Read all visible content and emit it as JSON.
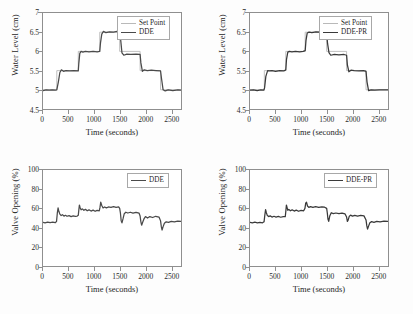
{
  "figure": {
    "background": "#fdfdfd",
    "axis_color": "#8f8f8f"
  },
  "colors": {
    "setpoint": "#b9b9b9",
    "dde": "#4a4a4a",
    "ddepr": "#3a3a3a"
  },
  "chart_data": [
    {
      "id": "water-level-dde",
      "type": "line",
      "title": "",
      "xlabel": "Time (seconds)",
      "ylabel": "Water Level (cm)",
      "xlim": [
        0,
        2700
      ],
      "ylim": [
        4.5,
        7
      ],
      "xticks": [
        0,
        500,
        1000,
        1500,
        2000,
        2500
      ],
      "yticks": [
        4.5,
        5,
        5.5,
        6,
        6.5,
        7
      ],
      "ytick_labels": [
        "4.5",
        "5",
        "5.5",
        "6",
        "6.5",
        "7"
      ],
      "xtick_labels": [
        "0",
        "500",
        "1000",
        "1500",
        "2000",
        "2500"
      ],
      "grid": false,
      "legend_position": "top-right",
      "series": [
        {
          "name": "Set Point",
          "color": "#b9b9b9",
          "x": [
            0,
            270,
            270,
            690,
            690,
            1110,
            1110,
            1500,
            1500,
            1900,
            1900,
            2300,
            2300,
            2700
          ],
          "y": [
            5,
            5,
            5.5,
            5.5,
            6,
            6,
            6.5,
            6.5,
            6,
            6,
            5.5,
            5.5,
            5,
            5
          ]
        },
        {
          "name": "DDE",
          "color": "#4a4a4a",
          "x": [
            0,
            60,
            120,
            180,
            240,
            270,
            300,
            330,
            360,
            400,
            450,
            520,
            600,
            690,
            700,
            720,
            745,
            780,
            830,
            900,
            980,
            1060,
            1110,
            1125,
            1150,
            1180,
            1230,
            1300,
            1380,
            1450,
            1500,
            1520,
            1545,
            1580,
            1640,
            1720,
            1820,
            1900,
            1915,
            1945,
            1980,
            2040,
            2120,
            2210,
            2300,
            2320,
            2350,
            2390,
            2450,
            2540,
            2640,
            2700
          ],
          "y": [
            4.98,
            5.0,
            4.99,
            5.0,
            4.99,
            5.0,
            5.2,
            5.45,
            5.52,
            5.48,
            5.5,
            5.49,
            5.5,
            5.49,
            5.68,
            5.95,
            6.0,
            5.98,
            6.0,
            5.99,
            6.0,
            5.99,
            6.0,
            6.22,
            6.45,
            6.52,
            6.49,
            6.51,
            6.5,
            6.52,
            6.5,
            6.3,
            5.96,
            5.9,
            5.93,
            5.92,
            5.93,
            5.92,
            5.7,
            5.48,
            5.52,
            5.5,
            5.51,
            5.5,
            5.49,
            5.28,
            5.0,
            4.97,
            5.0,
            4.98,
            5.0,
            4.99
          ]
        }
      ]
    },
    {
      "id": "water-level-ddepr",
      "type": "line",
      "title": "",
      "xlabel": "Time (seconds)",
      "ylabel": "Water Level (cm)",
      "xlim": [
        0,
        2700
      ],
      "ylim": [
        4.5,
        7
      ],
      "xticks": [
        0,
        500,
        1000,
        1500,
        2000,
        2500
      ],
      "yticks": [
        4.5,
        5,
        5.5,
        6,
        6.5,
        7
      ],
      "ytick_labels": [
        "4.5",
        "5",
        "5.5",
        "6",
        "6.5",
        "7"
      ],
      "xtick_labels": [
        "0",
        "500",
        "1000",
        "1500",
        "2000",
        "2500"
      ],
      "grid": false,
      "legend_position": "top-right",
      "series": [
        {
          "name": "Set Point",
          "color": "#b9b9b9",
          "x": [
            0,
            280,
            280,
            700,
            700,
            1080,
            1080,
            1500,
            1500,
            1890,
            1890,
            2270,
            2270,
            2700
          ],
          "y": [
            5,
            5,
            5.5,
            5.5,
            6,
            6,
            6.5,
            6.5,
            6,
            6,
            5.5,
            5.5,
            5,
            5
          ]
        },
        {
          "name": "DDE-PR",
          "color": "#3a3a3a",
          "x": [
            0,
            70,
            140,
            210,
            270,
            285,
            310,
            345,
            380,
            430,
            500,
            580,
            660,
            700,
            715,
            740,
            770,
            820,
            890,
            970,
            1040,
            1080,
            1095,
            1120,
            1155,
            1210,
            1290,
            1380,
            1460,
            1500,
            1518,
            1545,
            1580,
            1650,
            1740,
            1840,
            1890,
            1905,
            1935,
            1975,
            2040,
            2130,
            2220,
            2270,
            2290,
            2320,
            2370,
            2440,
            2530,
            2630,
            2700
          ],
          "y": [
            4.99,
            5.0,
            4.98,
            5.0,
            4.99,
            5.05,
            5.35,
            5.5,
            5.49,
            5.5,
            5.48,
            5.5,
            5.49,
            5.52,
            5.8,
            5.98,
            6.0,
            5.99,
            6.0,
            5.99,
            6.0,
            6.02,
            6.28,
            6.48,
            6.5,
            6.49,
            6.51,
            6.5,
            6.5,
            6.48,
            6.2,
            5.97,
            5.9,
            5.92,
            5.91,
            5.92,
            5.9,
            5.65,
            5.47,
            5.51,
            5.5,
            5.49,
            5.5,
            5.48,
            5.2,
            4.98,
            5.0,
            4.99,
            5.0,
            5.0,
            5.0
          ]
        }
      ]
    },
    {
      "id": "valve-opening-dde",
      "type": "line",
      "title": "",
      "xlabel": "Time (seconds)",
      "ylabel": "Valve Opening (%)",
      "xlim": [
        0,
        2700
      ],
      "ylim": [
        0,
        100
      ],
      "xticks": [
        0,
        500,
        1000,
        1500,
        2000,
        2500
      ],
      "yticks": [
        0,
        20,
        40,
        60,
        80,
        100
      ],
      "ytick_labels": [
        "0",
        "20",
        "40",
        "60",
        "80",
        "100"
      ],
      "xtick_labels": [
        "0",
        "500",
        "1000",
        "1500",
        "2000",
        "2500"
      ],
      "grid": false,
      "legend_position": "top-right",
      "series": [
        {
          "name": "DDE",
          "color": "#4a4a4a",
          "x": [
            0,
            40,
            90,
            140,
            190,
            240,
            265,
            280,
            295,
            310,
            330,
            355,
            380,
            410,
            440,
            470,
            510,
            550,
            590,
            630,
            670,
            690,
            700,
            712,
            725,
            745,
            770,
            800,
            830,
            865,
            900,
            940,
            980,
            1020,
            1060,
            1100,
            1115,
            1130,
            1150,
            1175,
            1205,
            1240,
            1280,
            1330,
            1380,
            1430,
            1480,
            1500,
            1515,
            1530,
            1545,
            1565,
            1590,
            1620,
            1660,
            1710,
            1760,
            1820,
            1880,
            1900,
            1915,
            1930,
            1950,
            1975,
            2005,
            2045,
            2090,
            2145,
            2205,
            2270,
            2300,
            2315,
            2330,
            2350,
            2375,
            2410,
            2455,
            2510,
            2570,
            2635,
            2700
          ],
          "y": [
            45.5,
            45.0,
            45.8,
            45.2,
            45.6,
            45.1,
            46.5,
            55.0,
            60.5,
            57.0,
            54.0,
            52.5,
            53.5,
            52.0,
            52.8,
            51.8,
            52.5,
            51.5,
            52.2,
            51.6,
            52.0,
            52.8,
            58.0,
            63.5,
            61.0,
            58.5,
            59.5,
            58.0,
            59.0,
            57.5,
            58.5,
            57.2,
            58.2,
            57.0,
            58.0,
            57.5,
            61.0,
            66.5,
            63.0,
            60.5,
            61.5,
            60.5,
            61.5,
            61.0,
            61.8,
            61.0,
            61.5,
            60.0,
            55.0,
            47.0,
            45.0,
            49.0,
            54.5,
            56.0,
            55.2,
            56.0,
            55.0,
            55.8,
            55.0,
            52.0,
            46.0,
            42.5,
            45.5,
            49.0,
            51.5,
            50.0,
            51.5,
            50.5,
            51.8,
            51.0,
            47.0,
            41.0,
            37.5,
            41.0,
            44.5,
            46.0,
            45.5,
            46.5,
            46.0,
            46.8,
            46.5
          ]
        }
      ]
    },
    {
      "id": "valve-opening-ddepr",
      "type": "line",
      "title": "",
      "xlabel": "Time (seconds)",
      "ylabel": "Valve Opening (%)",
      "xlim": [
        0,
        2700
      ],
      "ylim": [
        0,
        100
      ],
      "xticks": [
        0,
        500,
        1000,
        1500,
        2000,
        2500
      ],
      "yticks": [
        0,
        20,
        40,
        60,
        80,
        100
      ],
      "ytick_labels": [
        "0",
        "20",
        "40",
        "60",
        "80",
        "100"
      ],
      "xtick_labels": [
        "0",
        "500",
        "1000",
        "1500",
        "2000",
        "2500"
      ],
      "grid": false,
      "legend_position": "top-right",
      "series": [
        {
          "name": "DDE-PR",
          "color": "#3a3a3a",
          "x": [
            0,
            45,
            95,
            145,
            195,
            245,
            275,
            290,
            305,
            320,
            340,
            365,
            395,
            430,
            470,
            510,
            555,
            600,
            650,
            690,
            700,
            712,
            725,
            740,
            760,
            790,
            825,
            865,
            905,
            950,
            1000,
            1050,
            1075,
            1090,
            1105,
            1125,
            1150,
            1185,
            1230,
            1285,
            1345,
            1405,
            1460,
            1500,
            1512,
            1525,
            1540,
            1560,
            1590,
            1630,
            1680,
            1740,
            1800,
            1860,
            1890,
            1905,
            1920,
            1940,
            1968,
            2005,
            2050,
            2105,
            2165,
            2230,
            2270,
            2285,
            2300,
            2320,
            2345,
            2380,
            2425,
            2480,
            2545,
            2620,
            2700
          ],
          "y": [
            45.5,
            45.0,
            45.6,
            45.0,
            45.4,
            45.0,
            46.0,
            53.0,
            58.8,
            55.5,
            52.5,
            51.5,
            52.2,
            51.0,
            51.8,
            51.0,
            51.6,
            50.8,
            51.4,
            51.5,
            56.5,
            63.5,
            61.0,
            58.0,
            59.0,
            57.5,
            58.5,
            57.2,
            58.2,
            57.0,
            58.0,
            57.5,
            60.0,
            65.5,
            66.5,
            62.5,
            61.0,
            61.8,
            61.0,
            61.8,
            61.0,
            61.6,
            61.2,
            60.0,
            55.5,
            49.0,
            46.5,
            52.0,
            55.5,
            54.5,
            55.2,
            54.5,
            55.0,
            54.2,
            51.0,
            46.5,
            47.8,
            51.5,
            53.0,
            52.0,
            52.8,
            52.0,
            52.8,
            52.2,
            48.0,
            42.0,
            38.5,
            41.5,
            45.0,
            46.2,
            45.5,
            46.5,
            46.0,
            46.8,
            46.5
          ]
        }
      ]
    }
  ]
}
